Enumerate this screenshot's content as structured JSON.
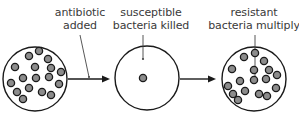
{
  "labels": {
    "antibiotic": {
      "line1": "antibiotic",
      "line2": "added"
    },
    "susceptible": {
      "line1": "susceptible",
      "line2": "bacteria killed"
    },
    "resistant": {
      "line1": "resistant",
      "line2": "bacteria multiply"
    }
  },
  "stages": [
    {
      "name": "initial-population",
      "bacteria_count": 19
    },
    {
      "name": "after-antibiotic",
      "bacteria_count": 1
    },
    {
      "name": "resistant-population",
      "bacteria_count": 19
    }
  ],
  "colors": {
    "outline": "#1a1a1a",
    "bacteria_fill": "#8c8c8c",
    "bacteria_stroke": "#1a1a1a",
    "text": "#3a3a3a"
  }
}
